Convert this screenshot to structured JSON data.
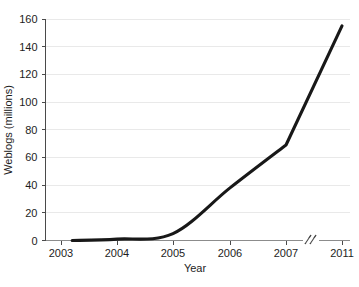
{
  "chart_data": {
    "type": "line",
    "title": "",
    "subtitle": "",
    "xlabel": "Year",
    "ylabel": "Weblogs (millions)",
    "x": [
      2003.2,
      2004,
      2005,
      2006,
      2007,
      2011
    ],
    "values": [
      0,
      1,
      5,
      38,
      69,
      155
    ],
    "series": [
      {
        "name": "Weblogs",
        "color": "#181818",
        "values": [
          0,
          1,
          5,
          38,
          69,
          155
        ]
      }
    ],
    "x_tick_labels": [
      "2003",
      "2004",
      "2005",
      "2006",
      "2007",
      "2011"
    ],
    "y_tick_labels": [
      "0",
      "20",
      "40",
      "60",
      "80",
      "100",
      "120",
      "140",
      "160"
    ],
    "y_ticks": [
      0,
      20,
      40,
      60,
      80,
      100,
      120,
      140,
      160
    ],
    "ylim": [
      0,
      160
    ],
    "grid": "horizontal",
    "legend": "none",
    "axis_break": {
      "between": [
        "2007",
        "2011"
      ],
      "marker": "//"
    },
    "annotations": [],
    "colors": {
      "line": "#181818",
      "gridline": "#e9e9e9",
      "axis": "#4a4a4a",
      "xaxis": "#8c8c8c",
      "background": "#ffffff",
      "text": "#1d1d1d"
    }
  }
}
